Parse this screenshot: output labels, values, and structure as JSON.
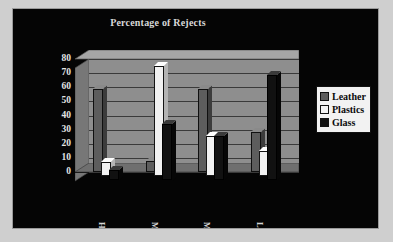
{
  "chart_data": {
    "type": "bar",
    "title": "Percentage of Rejects",
    "xlabel": "",
    "ylabel": "",
    "categories": [
      "Harrisburg",
      "Mobile",
      "Morristown",
      "Lafayette"
    ],
    "series": [
      {
        "name": "Leather",
        "color": "#5d5d5d",
        "values": [
          59,
          8,
          59,
          28
        ]
      },
      {
        "name": "Plastics",
        "color": "#f2f2f2",
        "values": [
          10,
          78,
          28,
          18
        ]
      },
      {
        "name": "Glass",
        "color": "#111111",
        "values": [
          7,
          40,
          31,
          74
        ]
      }
    ],
    "ylim": [
      0,
      80
    ],
    "yticks": [
      0,
      10,
      20,
      30,
      40,
      50,
      60,
      70,
      80
    ],
    "ytick_labels": [
      "0",
      "10",
      "20",
      "30",
      "40",
      "50",
      "60",
      "70",
      "80"
    ],
    "grid": true,
    "legend_position": "right",
    "style": "3d-column",
    "background": "#050505",
    "plot_background": "#8e8e8e",
    "text_color": "#d8d8d8"
  },
  "legend": {
    "items": [
      {
        "label": "Leather",
        "swatch": "#5d5d5d"
      },
      {
        "label": "Plastics",
        "swatch": "#f2f2f2"
      },
      {
        "label": "Glass",
        "swatch": "#111111"
      }
    ]
  }
}
